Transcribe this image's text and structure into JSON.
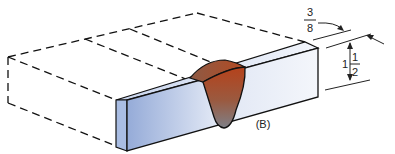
{
  "figure": {
    "label": "(B)"
  },
  "dimensions": {
    "top": {
      "numerator": "3",
      "denominator": "8"
    },
    "side": {
      "whole": "1",
      "numerator": "1",
      "denominator": "2"
    }
  },
  "colors": {
    "bar_front_light": "#eef2fa",
    "bar_front_dark": "#8fa6d6",
    "bar_end": "#a9bde3",
    "weld_top": "#b0451f",
    "weld_bottom": "#7c7f86",
    "outline": "#111111"
  }
}
